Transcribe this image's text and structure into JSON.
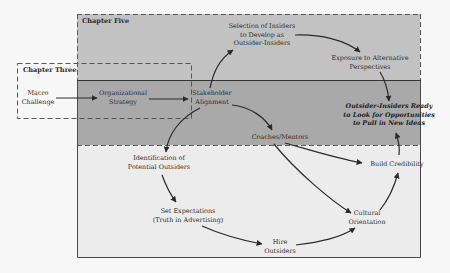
{
  "diagram": {
    "colors": {
      "page_background": "#f7f7f7",
      "chapter_five_band": "#c2c2c2",
      "middle_band": "#a9a9a9",
      "lower_band": "#ececec",
      "line": "#2a2a2a"
    },
    "regions": {
      "chapter_five": {
        "title": "Chapter Five"
      },
      "chapter_three": {
        "title": "Chapter Three"
      }
    },
    "nodes": {
      "macro_challenge": {
        "lines": [
          "Macro",
          "Challenge"
        ]
      },
      "organizational_strategy": {
        "lines": [
          "Organizational",
          "Strategy"
        ]
      },
      "stakeholder_alignment": {
        "lines": [
          "Stakeholder",
          "Alignment"
        ]
      },
      "selection_of_insiders": {
        "lines": [
          "Selection of Insiders",
          "to Develop as",
          "Outsider-Insiders"
        ]
      },
      "exposure": {
        "lines": [
          "Exposure to Alternative",
          "Perspectives"
        ]
      },
      "outsider_insiders_ready": {
        "lines": [
          "Outsider-Insiders Ready",
          "to Look for Opportunities",
          "to Pull in New Ideas"
        ]
      },
      "coaches_mentors": {
        "lines": [
          "Coaches/Mentors"
        ]
      },
      "identification": {
        "lines": [
          "Identification of",
          "Potential Outsiders"
        ]
      },
      "set_expectations": {
        "lines": [
          "Set Expectations",
          "(Truth in Advertising)"
        ]
      },
      "hire_outsiders": {
        "lines": [
          "Hire",
          "Outsiders"
        ]
      },
      "cultural_orientation": {
        "lines": [
          "Cultural",
          "Orientation"
        ]
      },
      "build_credibility": {
        "lines": [
          "Build Credibility"
        ]
      }
    },
    "edges": [
      {
        "from": "Macro Challenge",
        "to": "Organizational Strategy"
      },
      {
        "from": "Organizational Strategy",
        "to": "Stakeholder Alignment"
      },
      {
        "from": "Stakeholder Alignment",
        "to": "Selection of Insiders to Develop as Outsider-Insiders"
      },
      {
        "from": "Selection of Insiders to Develop as Outsider-Insiders",
        "to": "Exposure to Alternative Perspectives"
      },
      {
        "from": "Exposure to Alternative Perspectives",
        "to": "Outsider-Insiders Ready to Look for Opportunities to Pull in New Ideas"
      },
      {
        "from": "Stakeholder Alignment",
        "to": "Coaches/Mentors"
      },
      {
        "from": "Stakeholder Alignment",
        "to": "Identification of Potential Outsiders"
      },
      {
        "from": "Identification of Potential Outsiders",
        "to": "Set Expectations (Truth in Advertising)"
      },
      {
        "from": "Set Expectations (Truth in Advertising)",
        "to": "Hire Outsiders"
      },
      {
        "from": "Hire Outsiders",
        "to": "Cultural Orientation"
      },
      {
        "from": "Coaches/Mentors",
        "to": "Cultural Orientation"
      },
      {
        "from": "Coaches/Mentors",
        "to": "Build Credibility"
      },
      {
        "from": "Cultural Orientation",
        "to": "Build Credibility"
      },
      {
        "from": "Build Credibility",
        "to": "Outsider-Insiders Ready to Look for Opportunities to Pull in New Ideas"
      }
    ]
  }
}
